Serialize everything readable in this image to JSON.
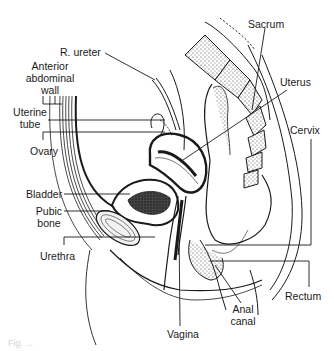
{
  "figure": {
    "caption": "Fig. ...",
    "colors": {
      "ink": "#1a1a1a",
      "background": "#ffffff",
      "bone_fill": "#f2f2f2"
    }
  },
  "labels": {
    "r_ureter": "R. ureter",
    "anterior_abdominal_wall": [
      "Anterior",
      "abdominal",
      "wall"
    ],
    "uterine_tube": [
      "Uterine",
      "tube"
    ],
    "ovary": "Ovary",
    "bladder": "Bladder",
    "pubic_bone": [
      "Pubic",
      "bone"
    ],
    "urethra": "Urethra",
    "sacrum": "Sacrum",
    "uterus": "Uterus",
    "cervix": "Cervix",
    "rectum": "Rectum",
    "anal_canal": [
      "Anal",
      "canal"
    ],
    "vagina": "Vagina"
  }
}
